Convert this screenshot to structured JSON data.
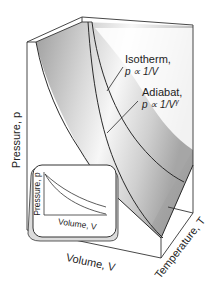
{
  "figure": {
    "type": "pVT surface diagram",
    "axes": {
      "pressure": "Pressure, p",
      "volume": "Volume, V",
      "temperature": "Temperature, T"
    },
    "annotations": {
      "isotherm": {
        "title": "Isotherm,",
        "formula": "p ∝ 1/V"
      },
      "adiabat": {
        "title": "Adiabat,",
        "formula_base": "p ∝ 1/V",
        "formula_exp": "γ"
      }
    },
    "inset": {
      "ylabel": "Pressure, p",
      "xlabel": "Volume, V"
    },
    "colors": {
      "line": "#2a2a2a",
      "surface_dark": "#a8a8a8",
      "surface_light": "#f2f2f2",
      "background": "#ffffff"
    }
  }
}
